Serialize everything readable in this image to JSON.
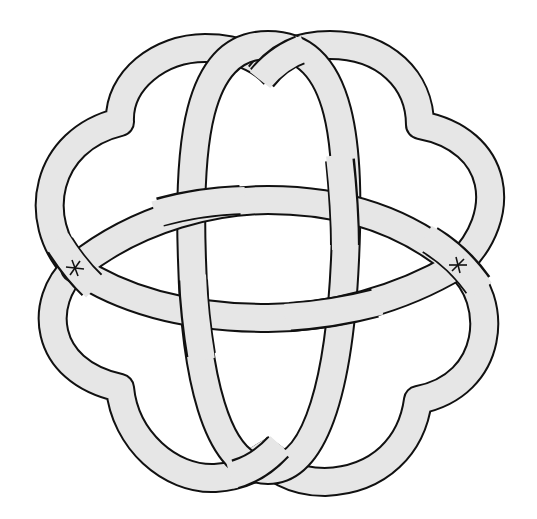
{
  "diagram": {
    "type": "knot-diagram",
    "colors": {
      "band_fill": "#e6e6e6",
      "outline": "#111111",
      "background": "#ffffff"
    },
    "markers": [
      {
        "name": "left-star",
        "glyph": "✶",
        "x": 75,
        "y": 268
      },
      {
        "name": "right-star",
        "glyph": "✶",
        "x": 458,
        "y": 265
      }
    ],
    "crossings": [
      {
        "id": "center-top-left",
        "over": "horizontal"
      },
      {
        "id": "center-top-right",
        "over": "vertical"
      },
      {
        "id": "center-bottom-left",
        "over": "vertical"
      },
      {
        "id": "center-bottom-right",
        "over": "horizontal"
      },
      {
        "id": "top",
        "over": "right-lobe-strand"
      },
      {
        "id": "bottom",
        "over": "left-lobe-strand"
      }
    ]
  }
}
